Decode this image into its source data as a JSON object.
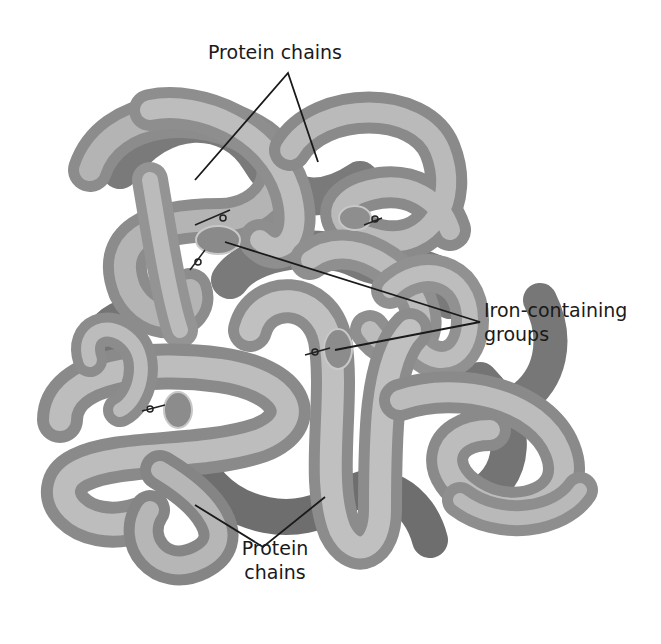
{
  "figure": {
    "labels": {
      "top": "Protein chains",
      "iron_line1": "Iron-containing",
      "iron_line2": "groups",
      "bottom_line1": "Protein",
      "bottom_line2": "chains"
    },
    "colors": {
      "background": "#ffffff",
      "tube_light": "#b8b8b8",
      "tube_mid": "#8e8e8e",
      "tube_dark": "#6a6a6a",
      "heme_disc": "#8a8a8a",
      "leader_line": "#1a1a1a"
    },
    "components": {
      "protein_chains": 4,
      "iron_groups": 4
    }
  }
}
